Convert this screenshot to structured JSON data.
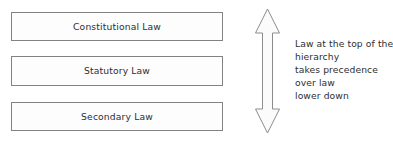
{
  "diagram": {
    "type": "hierarchy-diagram",
    "colors": {
      "background": "#ffffff",
      "box_fill": "#fdfdfd",
      "box_border": "#828282",
      "arrow_fill": "#fbfbfb",
      "arrow_border": "#8c8c8c",
      "text": "#2e2e2e"
    },
    "boxes": [
      {
        "id": "constitutional",
        "label": "Constitutional Law",
        "rank": 1
      },
      {
        "id": "statutory",
        "label": "Statutory Law",
        "rank": 2
      },
      {
        "id": "secondary",
        "label": "Secondary Law",
        "rank": 3
      }
    ],
    "arrow": {
      "name": "double-headed-vertical-arrow",
      "direction": "up-down",
      "meaning": "precedence ordering"
    },
    "annotation": {
      "lines": [
        "Law at the top of the",
        "hierarchy",
        "takes precedence",
        "over law",
        "lower down"
      ]
    }
  }
}
